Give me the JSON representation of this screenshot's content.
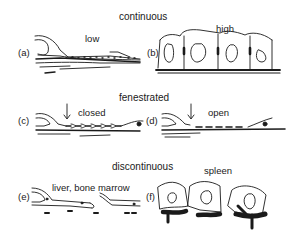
{
  "diagram": {
    "sections": [
      {
        "title": "continuous",
        "panels": [
          {
            "tag": "(a)",
            "label": "low"
          },
          {
            "tag": "(b)",
            "label": "high"
          }
        ]
      },
      {
        "title": "fenestrated",
        "panels": [
          {
            "tag": "(c)",
            "label": "closed"
          },
          {
            "tag": "(d)",
            "label": "open"
          }
        ]
      },
      {
        "title": "discontinuous",
        "panels": [
          {
            "tag": "(e)",
            "label": "liver, bone marrow"
          },
          {
            "tag": "(f)",
            "label": "spleen"
          }
        ]
      }
    ],
    "colors": {
      "ink": "#1a1a1a",
      "background": "#ffffff"
    }
  }
}
